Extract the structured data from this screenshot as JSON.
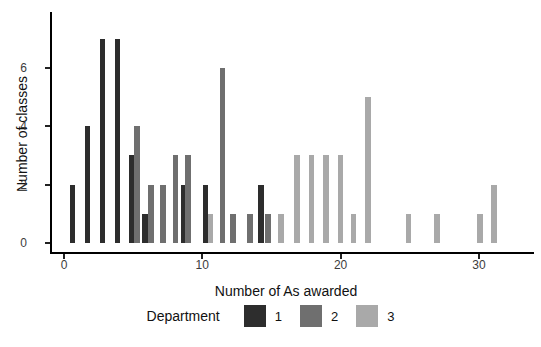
{
  "chart_data": {
    "type": "bar",
    "subtype": "dodged-histogram",
    "title": "",
    "xlabel": "Number of As awarded",
    "ylabel": "Number of classes",
    "xlim": [
      0,
      33.5
    ],
    "ylim": [
      0,
      7.3
    ],
    "x_ticks": [
      0,
      10,
      20,
      30
    ],
    "y_ticks": [
      0,
      2,
      4,
      6
    ],
    "grid": "off",
    "legend": {
      "title": "Department",
      "position": "bottom",
      "entries": [
        {
          "label": "1",
          "color": "#2d2d2d"
        },
        {
          "label": "2",
          "color": "#6f6f6f"
        },
        {
          "label": "3",
          "color": "#a9a9a9"
        }
      ]
    },
    "series": [
      {
        "name": "1",
        "color": "#2d2d2d",
        "points": [
          {
            "x": 1,
            "y": 2
          },
          {
            "x": 2,
            "y": 4
          },
          {
            "x": 3,
            "y": 7
          },
          {
            "x": 4,
            "y": 7
          },
          {
            "x": 5,
            "y": 3
          },
          {
            "x": 6,
            "y": 1
          },
          {
            "x": 9,
            "y": 2
          },
          {
            "x": 10,
            "y": 2
          },
          {
            "x": 14,
            "y": 2
          }
        ]
      },
      {
        "name": "2",
        "color": "#6f6f6f",
        "points": [
          {
            "x": 5,
            "y": 4
          },
          {
            "x": 6,
            "y": 2
          },
          {
            "x": 7,
            "y": 2
          },
          {
            "x": 8,
            "y": 3
          },
          {
            "x": 9,
            "y": 3
          },
          {
            "x": 11,
            "y": 6
          },
          {
            "x": 12,
            "y": 1
          },
          {
            "x": 13,
            "y": 1
          },
          {
            "x": 15,
            "y": 1
          }
        ]
      },
      {
        "name": "3",
        "color": "#a9a9a9",
        "points": [
          {
            "x": 10,
            "y": 1
          },
          {
            "x": 16,
            "y": 1
          },
          {
            "x": 17,
            "y": 3
          },
          {
            "x": 18,
            "y": 3
          },
          {
            "x": 19,
            "y": 3
          },
          {
            "x": 20,
            "y": 3
          },
          {
            "x": 21,
            "y": 1
          },
          {
            "x": 22,
            "y": 5
          },
          {
            "x": 25,
            "y": 1
          },
          {
            "x": 27,
            "y": 1
          },
          {
            "x": 30,
            "y": 1
          },
          {
            "x": 31,
            "y": 2
          }
        ]
      }
    ],
    "bars": [
      {
        "x": 1,
        "department": 1,
        "count": 2,
        "layout_x": 0.62
      },
      {
        "x": 2,
        "department": 1,
        "count": 4,
        "layout_x": 1.7
      },
      {
        "x": 3,
        "department": 1,
        "count": 7,
        "layout_x": 2.79
      },
      {
        "x": 4,
        "department": 1,
        "count": 7,
        "layout_x": 3.88
      },
      {
        "x": 5,
        "department": 1,
        "count": 3,
        "layout_x": 4.93
      },
      {
        "x": 5,
        "department": 2,
        "count": 4,
        "layout_x": 5.26
      },
      {
        "x": 6,
        "department": 1,
        "count": 1,
        "layout_x": 5.87
      },
      {
        "x": 6,
        "department": 2,
        "count": 2,
        "layout_x": 6.27
      },
      {
        "x": 7,
        "department": 2,
        "count": 2,
        "layout_x": 7.16
      },
      {
        "x": 8,
        "department": 2,
        "count": 3,
        "layout_x": 8.06
      },
      {
        "x": 9,
        "department": 1,
        "count": 2,
        "layout_x": 8.63
      },
      {
        "x": 9,
        "department": 2,
        "count": 3,
        "layout_x": 8.96
      },
      {
        "x": 10,
        "department": 1,
        "count": 2,
        "layout_x": 10.23
      },
      {
        "x": 10,
        "department": 3,
        "count": 1,
        "layout_x": 10.58
      },
      {
        "x": 11,
        "department": 2,
        "count": 6,
        "layout_x": 11.46
      },
      {
        "x": 12,
        "department": 2,
        "count": 1,
        "layout_x": 12.22
      },
      {
        "x": 13,
        "department": 2,
        "count": 1,
        "layout_x": 13.45
      },
      {
        "x": 14,
        "department": 1,
        "count": 2,
        "layout_x": 14.24
      },
      {
        "x": 15,
        "department": 2,
        "count": 1,
        "layout_x": 14.76
      },
      {
        "x": 16,
        "department": 3,
        "count": 1,
        "layout_x": 15.69
      },
      {
        "x": 17,
        "department": 3,
        "count": 3,
        "layout_x": 16.86
      },
      {
        "x": 18,
        "department": 3,
        "count": 3,
        "layout_x": 17.89
      },
      {
        "x": 19,
        "department": 3,
        "count": 3,
        "layout_x": 18.94
      },
      {
        "x": 20,
        "department": 3,
        "count": 3,
        "layout_x": 19.99
      },
      {
        "x": 21,
        "department": 3,
        "count": 1,
        "layout_x": 20.93
      },
      {
        "x": 22,
        "department": 3,
        "count": 5,
        "layout_x": 21.96
      },
      {
        "x": 25,
        "department": 3,
        "count": 1,
        "layout_x": 24.91
      },
      {
        "x": 27,
        "department": 3,
        "count": 1,
        "layout_x": 26.98
      },
      {
        "x": 30,
        "department": 3,
        "count": 1,
        "layout_x": 30.06
      },
      {
        "x": 31,
        "department": 3,
        "count": 2,
        "layout_x": 31.1
      }
    ]
  }
}
